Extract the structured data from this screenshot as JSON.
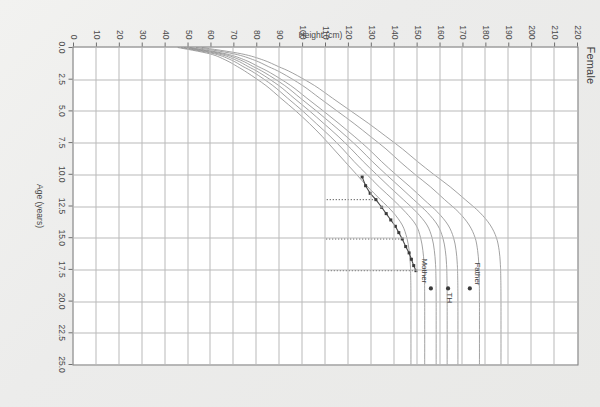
{
  "chart_title": "Female",
  "axes": {
    "x_title": "Age (years)",
    "y_title": "Height (cm)",
    "x_ticks": [
      "0.0",
      "2.5",
      "5.0",
      "7.5",
      "10.0",
      "12.5",
      "15.0",
      "17.5",
      "20.0",
      "22.5",
      "25.0"
    ],
    "y_ticks": [
      "0",
      "10",
      "20",
      "30",
      "40",
      "50",
      "60",
      "70",
      "80",
      "90",
      "100",
      "110",
      "120",
      "130",
      "140",
      "150",
      "160",
      "170",
      "180",
      "190",
      "200",
      "210",
      "220"
    ]
  },
  "annotations": {
    "father_label": "Father",
    "mother_label": "Mother",
    "th_label": "TH"
  },
  "colors": {
    "centile_curve": "#8a8a8a",
    "patient_line": "#4a4a4a",
    "marker": "#3a3a3a",
    "grid": "#b9b9b9",
    "frame": "#6e6e6e",
    "paper": "#ebebeb"
  },
  "chart_data": {
    "type": "line",
    "title": "Female",
    "xlabel": "Age (years)",
    "ylabel": "Height (cm)",
    "xlim": [
      0,
      25
    ],
    "ylim": [
      0,
      220
    ],
    "grid": true,
    "legend": "none",
    "x_tick_step": 2.5,
    "y_tick_step": 10,
    "series": [
      {
        "name": "0.4th centile",
        "kind": "centile",
        "x": [
          0,
          0.5,
          1,
          1.5,
          2,
          3,
          4,
          5,
          6,
          7,
          8,
          9,
          10,
          11,
          12,
          13,
          14,
          15,
          16,
          17,
          18,
          20,
          25
        ],
        "values": [
          45.5,
          59.5,
          66.5,
          71.5,
          76.0,
          84.0,
          90.5,
          97.0,
          103.0,
          108.5,
          113.5,
          118.5,
          123.5,
          128.5,
          134.0,
          139.5,
          143.5,
          145.5,
          146.5,
          147.0,
          147.2,
          147.3,
          147.3
        ]
      },
      {
        "name": "2nd centile",
        "kind": "centile",
        "x": [
          0,
          0.5,
          1,
          1.5,
          2,
          3,
          4,
          5,
          6,
          7,
          8,
          9,
          10,
          11,
          12,
          13,
          14,
          15,
          16,
          17,
          18,
          20,
          25
        ],
        "values": [
          47.0,
          61.5,
          69.0,
          74.0,
          79.0,
          87.0,
          93.5,
          100.0,
          106.0,
          112.0,
          117.5,
          122.5,
          128.0,
          133.5,
          139.5,
          145.0,
          149.5,
          151.5,
          152.5,
          153.0,
          153.2,
          153.3,
          153.3
        ]
      },
      {
        "name": "9th centile",
        "kind": "centile",
        "x": [
          0,
          0.5,
          1,
          1.5,
          2,
          3,
          4,
          5,
          6,
          7,
          8,
          9,
          10,
          11,
          12,
          13,
          14,
          15,
          16,
          17,
          18,
          20,
          25
        ],
        "values": [
          48.3,
          63.2,
          71.0,
          76.2,
          81.3,
          89.6,
          96.3,
          103.0,
          109.3,
          115.5,
          121.2,
          126.5,
          132.2,
          138.0,
          144.0,
          149.8,
          154.3,
          156.5,
          157.5,
          158.0,
          158.2,
          158.3,
          158.3
        ]
      },
      {
        "name": "25th centile",
        "kind": "centile",
        "x": [
          0,
          0.5,
          1,
          1.5,
          2,
          3,
          4,
          5,
          6,
          7,
          8,
          9,
          10,
          11,
          12,
          13,
          14,
          15,
          16,
          17,
          18,
          20,
          25
        ],
        "values": [
          49.6,
          64.9,
          73.0,
          78.4,
          83.6,
          92.2,
          99.1,
          106.0,
          112.6,
          119.0,
          125.0,
          130.5,
          136.4,
          142.5,
          148.5,
          154.4,
          158.9,
          161.2,
          162.3,
          162.8,
          163.0,
          163.1,
          163.1
        ]
      },
      {
        "name": "50th centile",
        "kind": "centile",
        "x": [
          0,
          0.5,
          1,
          1.5,
          2,
          3,
          4,
          5,
          6,
          7,
          8,
          9,
          10,
          11,
          12,
          13,
          14,
          15,
          16,
          17,
          18,
          20,
          25
        ],
        "values": [
          50.9,
          66.6,
          75.0,
          80.6,
          86.0,
          94.8,
          101.9,
          109.0,
          115.9,
          122.5,
          128.8,
          134.5,
          140.6,
          147.0,
          153.0,
          159.0,
          163.5,
          165.9,
          167.0,
          167.5,
          167.7,
          167.8,
          167.8
        ]
      },
      {
        "name": "91st centile",
        "kind": "centile",
        "x": [
          0,
          0.5,
          1,
          1.5,
          2,
          3,
          4,
          5,
          6,
          7,
          8,
          9,
          10,
          11,
          12,
          13,
          14,
          15,
          16,
          17,
          18,
          20,
          25
        ],
        "values": [
          53.5,
          70.0,
          79.0,
          85.0,
          90.8,
          100.0,
          107.5,
          115.0,
          122.5,
          129.5,
          136.4,
          142.5,
          149.0,
          155.9,
          162.0,
          168.2,
          172.7,
          175.3,
          176.4,
          176.9,
          177.1,
          177.2,
          177.2
        ]
      },
      {
        "name": "99.6th centile",
        "kind": "centile",
        "x": [
          0,
          0.5,
          1,
          1.5,
          2,
          3,
          4,
          5,
          6,
          7,
          8,
          9,
          10,
          11,
          12,
          13,
          14,
          15,
          16,
          17,
          18,
          20,
          25
        ],
        "values": [
          56.0,
          73.4,
          83.0,
          89.4,
          95.5,
          105.2,
          113.1,
          121.0,
          128.9,
          136.3,
          143.6,
          150.2,
          157.2,
          164.5,
          171.0,
          177.3,
          181.9,
          184.6,
          185.8,
          186.3,
          186.5,
          186.6,
          186.6
        ]
      },
      {
        "name": "Patient height measurements",
        "kind": "patient",
        "x": [
          10.2,
          10.9,
          11.5,
          12.0,
          12.6,
          13.1,
          13.6,
          14.1,
          14.6,
          15.1,
          15.7,
          16.2,
          16.7,
          17.2,
          17.6
        ],
        "values": [
          126.0,
          127.5,
          129.5,
          132.0,
          134.5,
          136.5,
          138.5,
          140.5,
          142.0,
          143.5,
          145.0,
          146.5,
          147.5,
          148.5,
          149.5
        ]
      }
    ],
    "points": [
      {
        "name": "Father",
        "x": 19.0,
        "y": 173.0,
        "label": "Father"
      },
      {
        "name": "TH",
        "x": 19.0,
        "y": 163.5,
        "label": "TH"
      },
      {
        "name": "Mother",
        "x": 19.0,
        "y": 156.0,
        "label": "Mother"
      }
    ],
    "droplines": [
      {
        "x": 12.0,
        "y_from": 132.0,
        "y_to": 110.0
      },
      {
        "x": 15.1,
        "y_from": 143.5,
        "y_to": 110.0
      },
      {
        "x": 17.6,
        "y_from": 149.5,
        "y_to": 110.0
      }
    ],
    "annotation_labels": [
      "Father",
      "Mother",
      "TH"
    ]
  }
}
